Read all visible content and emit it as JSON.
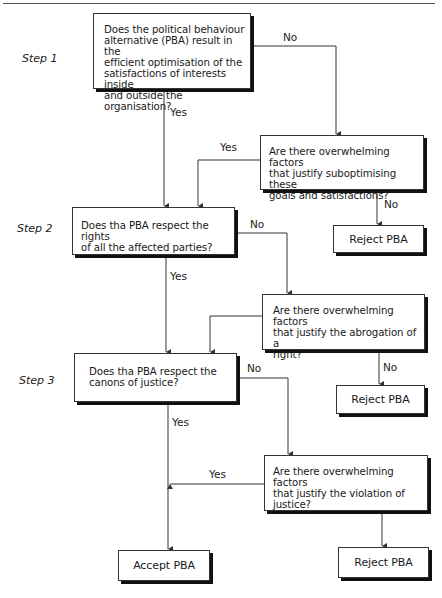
{
  "steps": [
    {
      "label": "Step 1"
    },
    {
      "label": "Step 2"
    },
    {
      "label": "Step 3"
    }
  ],
  "nodes": {
    "q1": {
      "text": "Does the political behaviour alternative (PBA) result in the efficient optimisation of the satisfactions of interests inside and outside the organisation?",
      "lines": [
        "Does the political behaviour",
        "alternative (PBA) result in the",
        "efficient optimisation of the",
        "satisfactions of interests inside",
        "and outside the organisation?"
      ]
    },
    "q1b": {
      "lines": [
        "Are there overwhelming factors",
        "that justify suboptimising these",
        "goals and satisfactions?"
      ]
    },
    "q2": {
      "lines": [
        "Does tha PBA respect the rights",
        "of all the affected parties?"
      ]
    },
    "q2b": {
      "lines": [
        "Are there overwhelming factors",
        "that justify the abrogation of a",
        "right?"
      ]
    },
    "q3": {
      "lines": [
        "Does tha PBA respect the",
        "canons of justice?"
      ]
    },
    "q3b": {
      "lines": [
        "Are there overwhelming factors",
        "that justify the violation of",
        "justice?"
      ]
    },
    "reject1": {
      "label": "Reject PBA"
    },
    "reject2": {
      "label": "Reject PBA"
    },
    "reject3": {
      "label": "Reject PBA"
    },
    "accept": {
      "label": "Accept PBA"
    }
  },
  "edge_labels": {
    "q1_no": "No",
    "q1_yes": "Yes",
    "q1b_yes": "Yes",
    "q1b_no": "No",
    "q2_no": "No",
    "q2_yes": "Yes",
    "q2b_no": "No",
    "q3_no": "No",
    "q3_yes": "Yes",
    "q3b_yes": "Yes"
  },
  "colors": {
    "line": "#333333",
    "shadow": "#111111",
    "text": "#1a1a1a"
  }
}
